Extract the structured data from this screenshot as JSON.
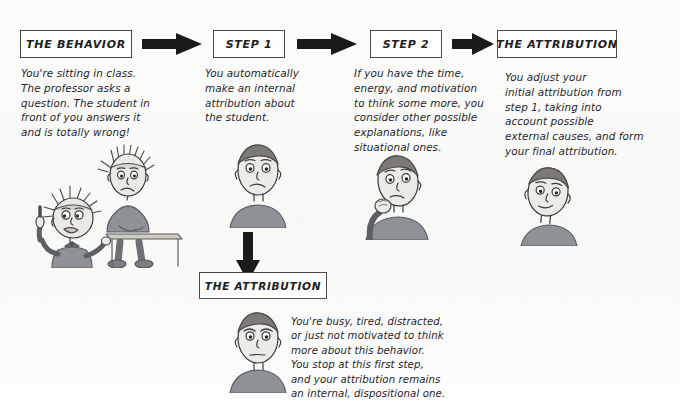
{
  "diagram": {
    "background_color": "#fbfbfa",
    "ink_color": "#26262a",
    "box_border_color": "#4a4a4a",
    "arrow_color": "#1a1a1a"
  },
  "boxes": {
    "behavior": {
      "label": "THE BEHAVIOR"
    },
    "step1": {
      "label": "STEP 1"
    },
    "step2": {
      "label": "STEP 2"
    },
    "attribution_final": {
      "label": "THE ATTRIBUTION"
    },
    "attribution_shortcut": {
      "label": "THE ATTRIBUTION"
    }
  },
  "paragraphs": {
    "behavior": "You're sitting in class.\nThe professor asks a\nquestion. The student in\nfront of you answers it\nand is totally wrong!",
    "step1": "You automatically\nmake an internal\nattribution about\nthe student.",
    "step2": "If you have the time,\nenergy, and motivation\nto think some more, you\nconsider other possible\nexplanations, like\nsituational ones.",
    "attribution_final": "You adjust your\ninitial attribution from\nstep 1, taking into\naccount possible\nexternal causes, and form\nyour final attribution.",
    "attribution_shortcut": "You're busy, tired, distracted,\nor just not motivated to think\nmore about this behavior.\nYou stop at this first step,\nand your attribution remains\nan internal, dispositional one."
  },
  "arrows": {
    "behavior_to_step1": {
      "direction": "right",
      "icon": "right-arrow-icon"
    },
    "step1_to_step2": {
      "direction": "right",
      "icon": "right-arrow-icon"
    },
    "step2_to_attribution": {
      "direction": "right",
      "icon": "right-arrow-icon"
    },
    "step1_to_shortcut": {
      "direction": "down",
      "icon": "down-arrow-icon"
    }
  },
  "illustrations": {
    "classroom_scene": {
      "caption": "professor with raised finger and student seated at desk",
      "icon": "classroom-scene-illustration"
    },
    "student_bust": {
      "caption": "student head and shoulders, neutral expression",
      "icon": "student-bust-illustration"
    },
    "thinker_bust": {
      "caption": "person with hand on chin, thinking",
      "icon": "thinker-bust-illustration"
    },
    "final_bust": {
      "caption": "person head and shoulders, relaxed expression",
      "icon": "final-bust-illustration"
    },
    "shortcut_bust": {
      "caption": "person head and shoulders, frowning",
      "icon": "shortcut-bust-illustration"
    }
  }
}
